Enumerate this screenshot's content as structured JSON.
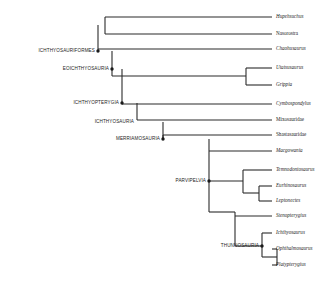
{
  "figure": {
    "type": "cladogram",
    "title": "",
    "background_color": "#ffffff",
    "line_color": "#2b2b2b",
    "text_color": "#1d1d1d"
  },
  "taxa": [
    {
      "id": "hupehsuchus",
      "label": "Hupehsuchus",
      "style": "italic",
      "tip_y": 17,
      "branch_x": 105
    },
    {
      "id": "nasorostra",
      "label": "Nasorostra",
      "style": "upright",
      "tip_y": 34,
      "branch_x": 98
    },
    {
      "id": "chaohusaurus",
      "label": "Chaohusaurus",
      "style": "italic",
      "tip_y": 49,
      "branch_x": 112
    },
    {
      "id": "utatsusaurus",
      "label": "Utatsusaurus",
      "style": "italic",
      "tip_y": 68,
      "branch_x": 246
    },
    {
      "id": "grippia",
      "label": "Grippia",
      "style": "italic",
      "tip_y": 85,
      "branch_x": 246
    },
    {
      "id": "cymbospondylus",
      "label": "Cymbospondylus",
      "style": "italic",
      "tip_y": 104,
      "branch_x": 122
    },
    {
      "id": "mixosauridae",
      "label": "Mixosauridae",
      "style": "upright",
      "tip_y": 120,
      "branch_x": 137
    },
    {
      "id": "shastasauridae",
      "label": "Shastasauridae",
      "style": "upright",
      "tip_y": 135,
      "branch_x": 163
    },
    {
      "id": "macgowania",
      "label": "Macgowania",
      "style": "italic",
      "tip_y": 151,
      "branch_x": 209
    },
    {
      "id": "temnodontosaurus",
      "label": "Temnodontosaurus",
      "style": "italic",
      "tip_y": 170,
      "branch_x": 243
    },
    {
      "id": "eurhinosaurus",
      "label": "Eurhinosaurus",
      "style": "italic",
      "tip_y": 186,
      "branch_x": 259
    },
    {
      "id": "leptonectes",
      "label": "Leptonectes",
      "style": "italic",
      "tip_y": 201,
      "branch_x": 259
    },
    {
      "id": "stenopterygius",
      "label": "Stenopterygius",
      "style": "italic",
      "tip_y": 216,
      "branch_x": 235
    },
    {
      "id": "ichthyosaurus",
      "label": "Ichthyosaurus",
      "style": "italic",
      "tip_y": 233,
      "branch_x": 262
    },
    {
      "id": "ophthalmosaurus",
      "label": "Ophthalmosaurus",
      "style": "italic",
      "tip_y": 249,
      "branch_x": 277
    },
    {
      "id": "platypterygius",
      "label": "Platypterygius",
      "style": "italic",
      "tip_y": 265,
      "branch_x": 277
    }
  ],
  "tip_label_x": 272,
  "clades": [
    {
      "id": "ichthyosauriformes",
      "label": "ICHTHYOSAURIFORMES",
      "label_x": 97,
      "label_y": 51,
      "node_x": 98,
      "node_y": 51,
      "dot": true
    },
    {
      "id": "eoichthyosauria",
      "label": "EOICHTHYOSAURIA",
      "label_x": 111,
      "label_y": 69,
      "node_x": 112,
      "node_y": 69,
      "dot": true
    },
    {
      "id": "ichthyopterygia",
      "label": "ICHTHYOPTERYGIA",
      "label_x": 121,
      "label_y": 103,
      "node_x": 122,
      "node_y": 103,
      "dot": true
    },
    {
      "id": "ichthyosauria",
      "label": "ICHTHYOSAURIA",
      "label_x": 136,
      "label_y": 122,
      "node_x": 137,
      "node_y": 122,
      "dot": false
    },
    {
      "id": "merriamosauria",
      "label": "MERRIAMOSAURIA",
      "label_x": 162,
      "label_y": 139,
      "node_x": 163,
      "node_y": 139,
      "dot": true
    },
    {
      "id": "parvipelvia",
      "label": "PARVIPELVIA",
      "label_x": 208,
      "label_y": 181,
      "node_x": 209,
      "node_y": 181,
      "dot": true
    },
    {
      "id": "thunnosauria",
      "label": "THUNNOSAURIA",
      "label_x": 261,
      "label_y": 246,
      "node_x": 262,
      "node_y": 246,
      "dot": true
    }
  ],
  "internal_nodes": [
    {
      "id": "hupehsuchia-node",
      "x": 105,
      "y_top": 17,
      "y_bottom": 34,
      "parent_x": 98
    },
    {
      "id": "ichthyosauriformes-node",
      "x": 98,
      "y_top": 25,
      "y_bottom": 51,
      "parent_x": 112
    },
    {
      "id": "chaohusaurus-join",
      "x": 112,
      "y_top": 49,
      "y_bottom": 103,
      "parent_x": 122
    },
    {
      "id": "utatsusaurus-grippia-node",
      "x": 246,
      "y_top": 68,
      "y_bottom": 85,
      "parent_x": 112
    },
    {
      "id": "eoichthyosauria-node",
      "x": 112,
      "y_top": 51,
      "y_bottom": 76,
      "parent_x": 122
    },
    {
      "id": "ichthyopterygia-node",
      "x": 122,
      "y_top": 103,
      "y_bottom": 122,
      "parent_x": 137
    },
    {
      "id": "ichthyosauria-node",
      "x": 137,
      "y_top": 120,
      "y_bottom": 139,
      "parent_x": 163
    },
    {
      "id": "merriamosauria-node",
      "x": 163,
      "y_top": 135,
      "y_bottom": 181,
      "parent_x": 209
    },
    {
      "id": "parvipelvia-node",
      "x": 209,
      "y_top": 151,
      "y_bottom": 212,
      "parent_x": 243
    },
    {
      "id": "leptonectia-node",
      "x": 243,
      "y_top": 170,
      "y_bottom": 193,
      "parent_x": 209
    },
    {
      "id": "eurhinosaurus-node",
      "x": 259,
      "y_top": 186,
      "y_bottom": 201,
      "parent_x": 243
    },
    {
      "id": "neoichthyosauria-node",
      "x": 235,
      "y_top": 216,
      "y_bottom": 246,
      "parent_x": 209
    },
    {
      "id": "thunnosauria-node",
      "x": 262,
      "y_top": 233,
      "y_bottom": 257,
      "parent_x": 235
    },
    {
      "id": "ophthalmosauria-node",
      "x": 277,
      "y_top": 249,
      "y_bottom": 265,
      "parent_x": 262
    }
  ],
  "segments": {
    "horizontal": [
      {
        "id": "h-hupehsuchus",
        "x1": 105,
        "x2": 272,
        "y": 17
      },
      {
        "id": "h-nasorostra",
        "x1": 105,
        "x2": 272,
        "y": 34
      },
      {
        "id": "h-chaohusaurus",
        "x1": 98,
        "x2": 272,
        "y": 49
      },
      {
        "id": "h-utatsusaurus",
        "x1": 246,
        "x2": 272,
        "y": 68
      },
      {
        "id": "h-grippia",
        "x1": 246,
        "x2": 272,
        "y": 85
      },
      {
        "id": "h-utagrip-stem",
        "x1": 112,
        "x2": 246,
        "y": 76
      },
      {
        "id": "h-cymbospondylus",
        "x1": 122,
        "x2": 272,
        "y": 104
      },
      {
        "id": "h-mixosauridae",
        "x1": 137,
        "x2": 272,
        "y": 120
      },
      {
        "id": "h-shastasauridae",
        "x1": 163,
        "x2": 272,
        "y": 135
      },
      {
        "id": "h-macgowania",
        "x1": 209,
        "x2": 272,
        "y": 151
      },
      {
        "id": "h-temnodontosaurus",
        "x1": 243,
        "x2": 272,
        "y": 170
      },
      {
        "id": "h-eurhinosaurus",
        "x1": 259,
        "x2": 272,
        "y": 186
      },
      {
        "id": "h-leptonectes",
        "x1": 259,
        "x2": 272,
        "y": 201
      },
      {
        "id": "h-eurlep-stem",
        "x1": 243,
        "x2": 259,
        "y": 193
      },
      {
        "id": "h-leptonectia-stem",
        "x1": 209,
        "x2": 243,
        "y": 181
      },
      {
        "id": "h-stenopterygius",
        "x1": 235,
        "x2": 272,
        "y": 216
      },
      {
        "id": "h-ichthyosaurus",
        "x1": 262,
        "x2": 272,
        "y": 233
      },
      {
        "id": "h-ophthalmosaurus",
        "x1": 277,
        "x2": 272,
        "y": 249
      },
      {
        "id": "h-platypterygius",
        "x1": 277,
        "x2": 272,
        "y": 265
      },
      {
        "id": "h-ophplat-stem",
        "x1": 262,
        "x2": 277,
        "y": 257
      },
      {
        "id": "h-thunnosauria-stem",
        "x1": 235,
        "x2": 262,
        "y": 246
      },
      {
        "id": "h-neoichthyo-stem",
        "x1": 209,
        "x2": 235,
        "y": 212
      }
    ],
    "vertical": [
      {
        "id": "v-hupeh-naso",
        "x": 105,
        "y1": 17,
        "y2": 34
      },
      {
        "id": "v-ichthyosauriformes",
        "x": 98,
        "y1": 25,
        "y2": 51
      },
      {
        "id": "v-eoichthyosauria",
        "x": 112,
        "y1": 51,
        "y2": 76
      },
      {
        "id": "v-utagrip",
        "x": 246,
        "y1": 68,
        "y2": 85
      },
      {
        "id": "v-ichthyopterygia",
        "x": 122,
        "y1": 69,
        "y2": 104
      },
      {
        "id": "v-ichthyosauria",
        "x": 137,
        "y1": 103,
        "y2": 120
      },
      {
        "id": "v-merriamosauria",
        "x": 163,
        "y1": 122,
        "y2": 139
      },
      {
        "id": "v-parvipelvia",
        "x": 209,
        "y1": 139,
        "y2": 181
      },
      {
        "id": "v-leptonectia",
        "x": 243,
        "y1": 170,
        "y2": 193
      },
      {
        "id": "v-eurlep",
        "x": 259,
        "y1": 186,
        "y2": 201
      },
      {
        "id": "v-parvi-lower",
        "x": 209,
        "y1": 181,
        "y2": 212
      },
      {
        "id": "v-neoichthyo",
        "x": 235,
        "y1": 212,
        "y2": 246
      },
      {
        "id": "v-thunnosauria",
        "x": 262,
        "y1": 233,
        "y2": 257
      },
      {
        "id": "v-ophplat",
        "x": 277,
        "y1": 249,
        "y2": 265
      },
      {
        "id": "v-merriam-stem",
        "x": 163,
        "y1": 135,
        "y2": 139
      }
    ]
  }
}
